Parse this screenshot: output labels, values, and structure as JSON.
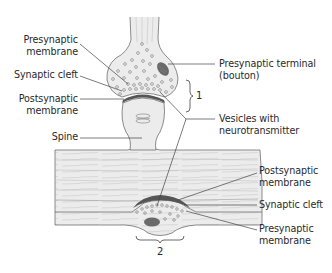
{
  "diagram": {
    "colors": {
      "tissue_fill": "#ececec",
      "outline": "#6e6e6e",
      "membrane_dark": "#555555",
      "mitochondrion": "#6a6a6a",
      "leader_line": "#444444",
      "text": "#2a2a2a"
    },
    "labels_left": [
      {
        "line1": "Presynaptic",
        "line2": "membrane"
      },
      {
        "line1": "Synaptic cleft"
      },
      {
        "line1": "Postsynaptic",
        "line2": "membrane"
      },
      {
        "line1": "Spine"
      }
    ],
    "labels_right_top": [
      {
        "line1": "Presynaptic terminal",
        "line2": "(bouton)"
      },
      {
        "line1": "Vesicles with",
        "line2": "neurotransmitter"
      }
    ],
    "labels_right_bottom": [
      {
        "line1": "Postsynaptic",
        "line2": "membrane"
      },
      {
        "line1": "Synaptic cleft"
      },
      {
        "line1": "Presynaptic",
        "line2": "membrane"
      }
    ],
    "brace_labels": {
      "top": "1",
      "bottom": "2"
    }
  }
}
